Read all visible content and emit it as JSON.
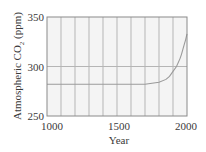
{
  "chart_data": {
    "type": "line",
    "title": "",
    "xlabel": "Year",
    "ylabel": "Atmospheric CO₂ (ppm)",
    "xlim": [
      1000,
      2000
    ],
    "ylim": [
      250,
      350
    ],
    "x_ticks": [
      1000,
      1500,
      2000
    ],
    "y_ticks": [
      250,
      300,
      350
    ],
    "grid": {
      "vertical_every": 100,
      "horizontal_at": [
        300
      ]
    },
    "series": [
      {
        "name": "Atmospheric CO2",
        "x": [
          1000,
          1100,
          1200,
          1300,
          1400,
          1500,
          1600,
          1700,
          1750,
          1800,
          1850,
          1875,
          1900,
          1925,
          1950,
          1960,
          1970,
          1980,
          1990,
          2000
        ],
        "values": [
          282,
          282,
          282,
          282,
          282,
          282,
          282,
          282,
          283,
          284,
          287,
          290,
          295,
          300,
          308,
          312,
          317,
          322,
          327,
          333
        ]
      }
    ],
    "colors": {
      "plot_background": "#f4f4f4",
      "gridline": "#b5b5b5",
      "frame": "#8a8a8a",
      "line": "#9a9a9a"
    }
  },
  "labels": {
    "xlabel": "Year",
    "ylabel_prefix": "Atmospheric CO",
    "ylabel_sub": "2",
    "ylabel_suffix": " (ppm)",
    "x_ticks": [
      "1000",
      "1500",
      "2000"
    ],
    "y_ticks": [
      "350",
      "300",
      "250"
    ]
  }
}
